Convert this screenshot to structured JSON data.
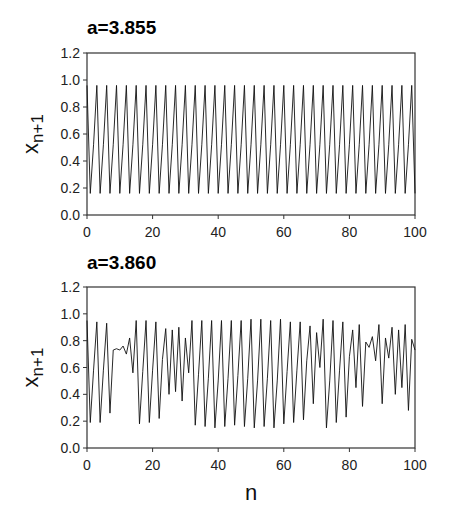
{
  "figure": {
    "xlabel": "n",
    "ylabel_main": "x",
    "ylabel_sub": "n+1"
  },
  "chart_data": [
    {
      "type": "line",
      "title": "a=3.855",
      "xlabel": "",
      "ylabel": "x_{n+1}",
      "xlim": [
        0,
        100
      ],
      "ylim": [
        0.0,
        1.2
      ],
      "xticks": [
        0,
        20,
        40,
        60,
        80,
        100
      ],
      "yticks": [
        "0.0",
        "0.2",
        "0.4",
        "0.6",
        "0.8",
        "1.0",
        "1.2"
      ],
      "grid": false,
      "legend": null,
      "pattern": "period-3 cycle: 0.96, 0.16, 0.52 repeating",
      "x": [
        0,
        1,
        2,
        3,
        4,
        5,
        6,
        7,
        8,
        9,
        10,
        11,
        12,
        13,
        14,
        15,
        16,
        17,
        18,
        19,
        20,
        21,
        22,
        23,
        24,
        25,
        26,
        27,
        28,
        29,
        30,
        31,
        32,
        33,
        34,
        35,
        36,
        37,
        38,
        39,
        40,
        41,
        42,
        43,
        44,
        45,
        46,
        47,
        48,
        49,
        50,
        51,
        52,
        53,
        54,
        55,
        56,
        57,
        58,
        59,
        60,
        61,
        62,
        63,
        64,
        65,
        66,
        67,
        68,
        69,
        70,
        71,
        72,
        73,
        74,
        75,
        76,
        77,
        78,
        79,
        80,
        81,
        82,
        83,
        84,
        85,
        86,
        87,
        88,
        89,
        90,
        91,
        92,
        93,
        94,
        95,
        96,
        97,
        98,
        99,
        100
      ],
      "values": [
        0.96,
        0.16,
        0.52,
        0.96,
        0.16,
        0.52,
        0.96,
        0.16,
        0.52,
        0.96,
        0.16,
        0.52,
        0.96,
        0.16,
        0.52,
        0.96,
        0.16,
        0.52,
        0.96,
        0.16,
        0.52,
        0.96,
        0.16,
        0.52,
        0.96,
        0.16,
        0.52,
        0.96,
        0.16,
        0.52,
        0.96,
        0.16,
        0.52,
        0.96,
        0.16,
        0.52,
        0.96,
        0.16,
        0.52,
        0.96,
        0.16,
        0.52,
        0.96,
        0.16,
        0.52,
        0.96,
        0.16,
        0.52,
        0.96,
        0.16,
        0.52,
        0.96,
        0.16,
        0.52,
        0.96,
        0.16,
        0.52,
        0.96,
        0.16,
        0.52,
        0.96,
        0.16,
        0.52,
        0.96,
        0.16,
        0.52,
        0.96,
        0.16,
        0.52,
        0.96,
        0.16,
        0.52,
        0.96,
        0.16,
        0.52,
        0.96,
        0.16,
        0.52,
        0.96,
        0.16,
        0.52,
        0.96,
        0.16,
        0.52,
        0.96,
        0.16,
        0.52,
        0.96,
        0.16,
        0.52,
        0.96,
        0.16,
        0.52,
        0.96,
        0.16,
        0.52,
        0.96,
        0.16,
        0.52,
        0.96,
        0.16
      ]
    },
    {
      "type": "line",
      "title": "a=3.860",
      "xlabel": "n",
      "ylabel": "x_{n+1}",
      "xlim": [
        0,
        100
      ],
      "ylim": [
        0.0,
        1.2
      ],
      "xticks": [
        0,
        20,
        40,
        60,
        80,
        100
      ],
      "yticks": [
        "0.0",
        "0.2",
        "0.4",
        "0.6",
        "0.8",
        "1.0",
        "1.2"
      ],
      "grid": false,
      "legend": null,
      "pattern": "intermittent period-3 with chaotic bursts",
      "x": [
        0,
        1,
        2,
        3,
        4,
        5,
        6,
        7,
        8,
        9,
        10,
        11,
        12,
        13,
        14,
        15,
        16,
        17,
        18,
        19,
        20,
        21,
        22,
        23,
        24,
        25,
        26,
        27,
        28,
        29,
        30,
        31,
        32,
        33,
        34,
        35,
        36,
        37,
        38,
        39,
        40,
        41,
        42,
        43,
        44,
        45,
        46,
        47,
        48,
        49,
        50,
        51,
        52,
        53,
        54,
        55,
        56,
        57,
        58,
        59,
        60,
        61,
        62,
        63,
        64,
        65,
        66,
        67,
        68,
        69,
        70,
        71,
        72,
        73,
        74,
        75,
        76,
        77,
        78,
        79,
        80,
        81,
        82,
        83,
        84,
        85,
        86,
        87,
        88,
        89,
        90,
        91,
        92,
        93,
        94,
        95,
        96,
        97,
        98,
        99,
        100
      ],
      "values": [
        0.95,
        0.19,
        0.58,
        0.94,
        0.19,
        0.58,
        0.93,
        0.26,
        0.73,
        0.74,
        0.73,
        0.76,
        0.7,
        0.82,
        0.56,
        0.95,
        0.18,
        0.57,
        0.95,
        0.19,
        0.58,
        0.94,
        0.22,
        0.66,
        0.89,
        0.4,
        0.88,
        0.42,
        0.9,
        0.35,
        0.82,
        0.56,
        0.95,
        0.17,
        0.55,
        0.95,
        0.16,
        0.52,
        0.95,
        0.15,
        0.5,
        0.95,
        0.16,
        0.52,
        0.95,
        0.17,
        0.54,
        0.95,
        0.16,
        0.52,
        0.96,
        0.15,
        0.5,
        0.96,
        0.16,
        0.52,
        0.95,
        0.15,
        0.5,
        0.96,
        0.18,
        0.57,
        0.94,
        0.19,
        0.58,
        0.94,
        0.21,
        0.65,
        0.91,
        0.33,
        0.86,
        0.6,
        0.96,
        0.15,
        0.5,
        0.95,
        0.19,
        0.58,
        0.94,
        0.23,
        0.68,
        0.88,
        0.45,
        0.92,
        0.31,
        0.79,
        0.75,
        0.83,
        0.65,
        0.92,
        0.33,
        0.82,
        0.67,
        0.9,
        0.4,
        0.88,
        0.45,
        0.92,
        0.28,
        0.81,
        0.73
      ]
    }
  ],
  "layout": {
    "panels": [
      {
        "left": 87,
        "right": 415,
        "top": 53,
        "bottom": 215,
        "title_y": 34
      },
      {
        "left": 87,
        "right": 415,
        "top": 287,
        "bottom": 448,
        "title_y": 269
      }
    ],
    "ylabel_x": 38,
    "xlabel_y": 500,
    "line_color": "#111111",
    "axis_color": "#333333"
  }
}
